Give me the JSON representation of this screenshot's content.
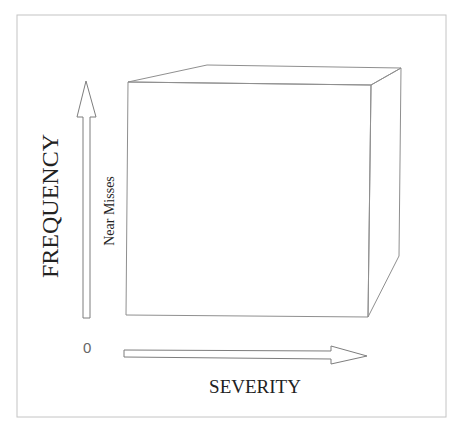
{
  "diagram": {
    "y_axis_label": "FREQUENCY",
    "x_axis_label": "SEVERITY",
    "origin_label": "0",
    "inner_label": "Near Misses",
    "stroke_color": "#8a8a8a",
    "frame_color": "#bdbdbd",
    "text_color": "#222222"
  }
}
